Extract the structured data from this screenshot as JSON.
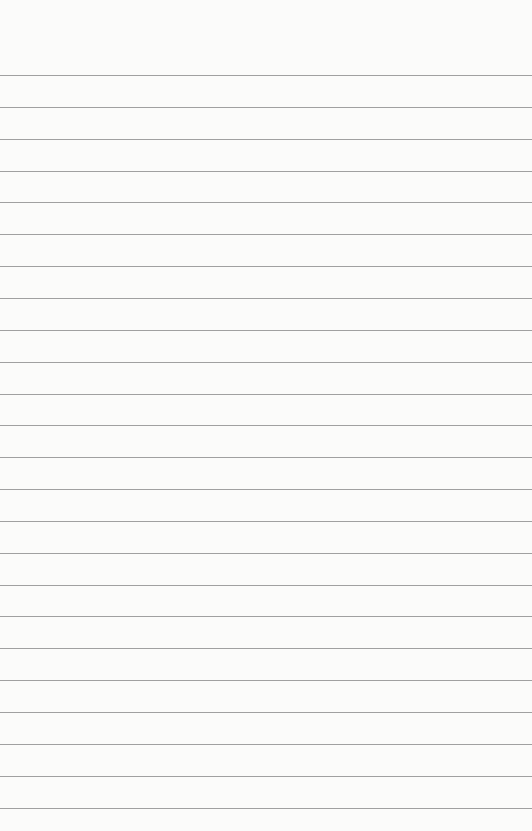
{
  "paper": {
    "type": "lined-paper",
    "background_color": "#fbfbfa",
    "line_color": "#8f8f8f",
    "first_line_y": 75,
    "line_spacing": 31.85,
    "line_count": 24
  }
}
